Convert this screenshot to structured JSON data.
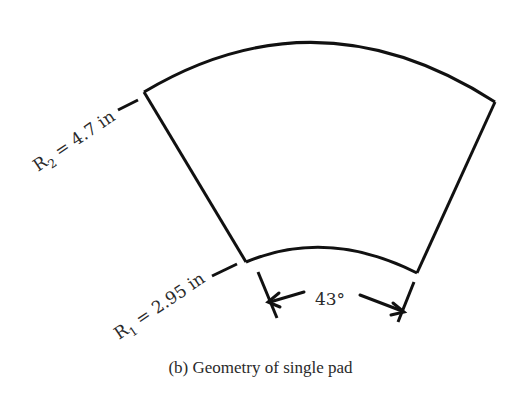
{
  "figure": {
    "caption": "(b) Geometry of single pad",
    "shape": "annular-sector pad",
    "labels": {
      "outer_radius": {
        "symbol": "R",
        "subscript": "2",
        "text": " = 4.7 in"
      },
      "inner_radius": {
        "symbol": "R",
        "subscript": "1",
        "text": " = 2.95 in"
      },
      "angle": "43°"
    },
    "colors": {
      "stroke": "#111111",
      "text": "#2a2a2a",
      "background": "#ffffff"
    }
  }
}
